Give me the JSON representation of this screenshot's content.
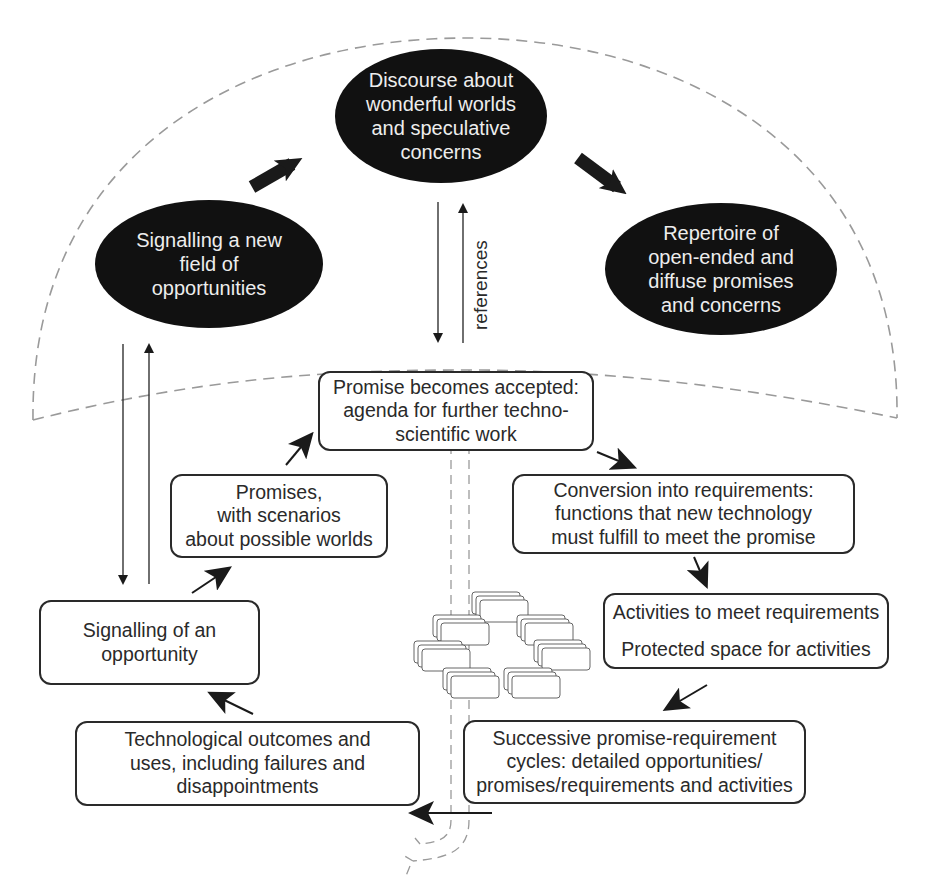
{
  "diagram": {
    "type": "promise-requirement cycle",
    "colors": {
      "ellipse_fill": "#111111",
      "ellipse_text": "#ededed",
      "box_border": "#2a2a2a",
      "dashed_line": "#9a9a9a",
      "arrow": "#1a1a1a"
    },
    "ellipses": {
      "discourse": "Discourse about\nwonderful worlds\nand speculative\nconcerns",
      "signalling_field": "Signalling a new\nfield of\nopportunities",
      "repertoire": "Repertoire of\nopen-ended and\ndiffuse promises\nand concerns"
    },
    "labels": {
      "references": "references"
    },
    "boxes": {
      "promise_accepted": "Promise becomes accepted:\nagenda for further techno-\nscientific work",
      "promises_scenarios": "Promises,\nwith scenarios\nabout possible worlds",
      "conversion": "Conversion into requirements:\nfunctions that new technology\nmust fulfill to meet the promise",
      "activities_line1": "Activities to meet requirements",
      "activities_line2": "Protected space for activities",
      "signalling_opportunity": "Signalling of an\nopportunity",
      "successive_cycles": "Successive promise-requirement\ncycles: detailed opportunities/\npromises/requirements and activities",
      "outcomes": "Technological outcomes and\nuses, including failures and\ndisappointments"
    }
  }
}
